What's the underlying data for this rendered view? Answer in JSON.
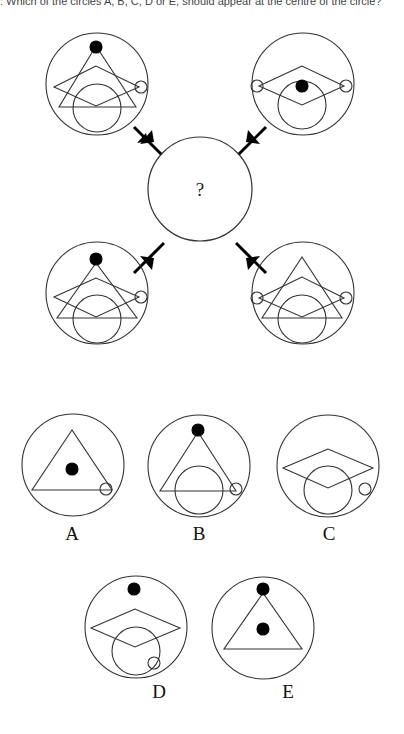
{
  "question": {
    "text": ": Which of the circles A, B, C, D or E, should appear at the centre of the circle?"
  },
  "puzzle": {
    "center_symbol": "?",
    "outer_circles": [
      {
        "position": "top-left",
        "elements": [
          "large-circle",
          "triangle",
          "diamond",
          "small-circle-right",
          "black-dot-top"
        ]
      },
      {
        "position": "top-right",
        "elements": [
          "large-circle",
          "diamond",
          "small-circle-left",
          "small-circle-right",
          "black-dot-center"
        ]
      },
      {
        "position": "bottom-left",
        "elements": [
          "large-circle",
          "triangle",
          "diamond",
          "small-circle-right",
          "black-dot-top"
        ]
      },
      {
        "position": "bottom-right",
        "elements": [
          "large-circle",
          "triangle",
          "diamond",
          "small-circle-left",
          "small-circle-right"
        ]
      }
    ]
  },
  "options": [
    {
      "label": "A",
      "elements": [
        "triangle",
        "black-dot-center",
        "small-circle-bottom-right"
      ]
    },
    {
      "label": "B",
      "elements": [
        "triangle",
        "black-dot-top",
        "large-circle",
        "small-circle-bottom-right"
      ]
    },
    {
      "label": "C",
      "elements": [
        "diamond",
        "large-circle",
        "small-circle-right"
      ]
    },
    {
      "label": "D",
      "elements": [
        "diamond",
        "large-circle",
        "black-dot-top",
        "small-circle-bottom-right"
      ]
    },
    {
      "label": "E",
      "elements": [
        "triangle",
        "black-dot-top",
        "black-dot-center"
      ]
    }
  ],
  "colors": {
    "stroke": "#333333",
    "fill_dot": "#000000",
    "background": "#ffffff"
  }
}
